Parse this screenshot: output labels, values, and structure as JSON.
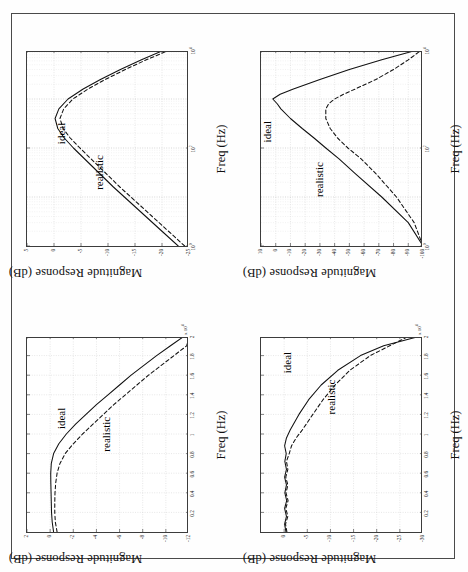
{
  "figure": {
    "background": "#fefefe",
    "frame_color": "#4a4a4a",
    "orientation": "rotated-90-ccw",
    "panel_count": 4
  },
  "labels": {
    "ylabel": "Magnitude Response (dB)",
    "xlabel": "Freq (Hz)",
    "series_ideal": "ideal",
    "series_realistic": "realistic"
  },
  "chart_data": [
    {
      "id": "top-left",
      "type": "line",
      "title": "",
      "xlabel": "Freq (Hz)",
      "ylabel": "Magnitude Response (dB)",
      "xscale": "log",
      "yscale": "linear",
      "xlim": [
        1,
        10000
      ],
      "ylim": [
        -25,
        5
      ],
      "xticks": [
        "10",
        "10",
        "10"
      ],
      "xtick_exponents": [
        "0",
        "2",
        "4"
      ],
      "yticks": [
        "5",
        "0",
        "-5",
        "-10",
        "-15",
        "-20",
        "-25"
      ],
      "grid": true,
      "annotations": [
        {
          "text": "ideal",
          "x": 120,
          "y": -2
        },
        {
          "text": "realistic",
          "x": 14,
          "y": -9
        }
      ],
      "series": [
        {
          "name": "ideal",
          "style": "solid",
          "x": [
            1,
            2,
            4,
            8,
            16,
            32,
            64,
            100,
            160,
            250,
            400,
            630,
            1000,
            1600,
            2500,
            4000,
            6300,
            10000
          ],
          "y": [
            -23.0,
            -20.0,
            -17.0,
            -14.0,
            -11.0,
            -8.2,
            -5.4,
            -3.6,
            -1.9,
            -0.7,
            -0.2,
            -0.9,
            -2.6,
            -5.4,
            -8.6,
            -12.3,
            -16.2,
            -20.4
          ]
        },
        {
          "name": "realistic",
          "style": "dashed",
          "x": [
            1,
            2,
            4,
            8,
            16,
            32,
            64,
            100,
            160,
            250,
            400,
            630,
            1000,
            1600,
            2500,
            4000,
            6300,
            10000
          ],
          "y": [
            -24.2,
            -21.2,
            -18.2,
            -15.2,
            -12.2,
            -9.4,
            -6.6,
            -4.8,
            -3.0,
            -1.7,
            -1.1,
            -1.8,
            -3.5,
            -6.3,
            -9.5,
            -13.2,
            -17.1,
            -21.4
          ]
        }
      ]
    },
    {
      "id": "top-right",
      "type": "line",
      "title": "",
      "xlabel": "Freq (Hz)",
      "ylabel": "Magnitude Response (dB)",
      "xscale": "log",
      "yscale": "linear",
      "xlim": [
        1,
        10000
      ],
      "ylim": [
        -100,
        10
      ],
      "xticks": [
        "10",
        "10",
        "10"
      ],
      "xtick_exponents": [
        "0",
        "2",
        "4"
      ],
      "yticks": [
        "10",
        "0",
        "-10",
        "-20",
        "-30",
        "-40",
        "-50",
        "-60",
        "-70",
        "-80",
        "-90",
        "-100"
      ],
      "grid": true,
      "annotations": [
        {
          "text": "ideal",
          "x": 130,
          "y": 3
        },
        {
          "text": "realistic",
          "x": 10,
          "y": -32
        }
      ],
      "series": [
        {
          "name": "ideal",
          "style": "solid",
          "x": [
            1,
            3,
            10,
            30,
            60,
            100,
            160,
            250,
            400,
            630,
            800,
            1000,
            1250,
            1600,
            2500,
            4000,
            6300,
            10000
          ],
          "y": [
            -100,
            -90,
            -72,
            -54,
            -43,
            -34,
            -26,
            -18,
            -10,
            -3.5,
            -1.0,
            2.0,
            -3.0,
            -12,
            -30,
            -50,
            -72,
            -96
          ]
        },
        {
          "name": "realistic",
          "style": "dashed",
          "x": [
            1,
            3,
            10,
            30,
            60,
            100,
            160,
            250,
            400,
            630,
            800,
            1000,
            1250,
            1600,
            2500,
            4000,
            6300,
            10000
          ],
          "y": [
            -100,
            -94,
            -82,
            -68,
            -58,
            -49,
            -42,
            -37,
            -34,
            -34,
            -36,
            -40,
            -46,
            -54,
            -68,
            -80,
            -90,
            -99
          ]
        }
      ]
    },
    {
      "id": "bottom-left",
      "type": "line",
      "title": "",
      "xlabel": "Freq (Hz)",
      "ylabel": "Magnitude Response (dB)",
      "xscale": "linear",
      "yscale": "linear",
      "xlim": [
        0,
        2
      ],
      "ylim": [
        -12,
        2
      ],
      "x_multiplier": "x 10",
      "x_multiplier_exponent": "4",
      "xticks": [
        "0.2",
        "0.4",
        "0.6",
        "0.8",
        "1",
        "1.2",
        "1.4",
        "1.6",
        "1.8",
        "2"
      ],
      "yticks": [
        "2",
        "0",
        "-2",
        "-4",
        "-6",
        "-8",
        "-10",
        "-12"
      ],
      "grid": true,
      "annotations": [
        {
          "text": "ideal",
          "x": 1.05,
          "y": -1.3
        },
        {
          "text": "realistic",
          "x": 0.82,
          "y": -5.2
        }
      ],
      "series": [
        {
          "name": "ideal",
          "style": "solid",
          "x": [
            0,
            0.1,
            0.2,
            0.3,
            0.4,
            0.5,
            0.6,
            0.7,
            0.8,
            0.9,
            1.0,
            1.1,
            1.2,
            1.3,
            1.4,
            1.5,
            1.6,
            1.7,
            1.8,
            1.9,
            2.0
          ],
          "y": [
            -0.3,
            -0.18,
            -0.12,
            -0.1,
            -0.08,
            -0.06,
            -0.05,
            -0.1,
            -0.3,
            -0.75,
            -1.4,
            -2.2,
            -3.1,
            -4.0,
            -5.0,
            -6.0,
            -7.0,
            -8.1,
            -9.2,
            -10.4,
            -11.6
          ]
        },
        {
          "name": "realistic",
          "style": "dashed",
          "x": [
            0,
            0.1,
            0.2,
            0.3,
            0.4,
            0.5,
            0.6,
            0.7,
            0.8,
            0.9,
            1.0,
            1.1,
            1.2,
            1.3,
            1.4,
            1.5,
            1.6,
            1.7,
            1.8,
            1.9,
            2.0
          ],
          "y": [
            -0.6,
            -0.45,
            -0.4,
            -0.4,
            -0.42,
            -0.48,
            -0.6,
            -0.85,
            -1.3,
            -2.0,
            -2.8,
            -3.7,
            -4.6,
            -5.5,
            -6.5,
            -7.5,
            -8.5,
            -9.6,
            -10.7,
            -11.8,
            -12.0
          ]
        }
      ]
    },
    {
      "id": "bottom-right",
      "type": "line",
      "title": "",
      "xlabel": "Freq (Hz)",
      "ylabel": "Magnitude Response (dB)",
      "xscale": "linear",
      "yscale": "linear",
      "xlim": [
        0,
        2
      ],
      "ylim": [
        -30,
        5
      ],
      "x_multiplier": "x 10",
      "x_multiplier_exponent": "4",
      "xticks": [
        "0.2",
        "0.4",
        "0.6",
        "0.8",
        "1",
        "1.2",
        "1.4",
        "1.6",
        "1.8",
        "2"
      ],
      "yticks": [
        "0",
        "-5",
        "-10",
        "-15",
        "-20",
        "-25",
        "-30"
      ],
      "grid": true,
      "annotations": [
        {
          "text": "ideal",
          "x": 1.62,
          "y": -1.5
        },
        {
          "text": "realistic",
          "x": 1.2,
          "y": -11
        }
      ],
      "series": [
        {
          "name": "ideal",
          "style": "solid",
          "x": [
            0,
            0.08,
            0.16,
            0.24,
            0.32,
            0.4,
            0.48,
            0.56,
            0.64,
            0.72,
            0.8,
            0.88,
            0.96,
            1.04,
            1.2,
            1.35,
            1.5,
            1.65,
            1.8,
            1.9,
            2.0
          ],
          "y": [
            -0.4,
            -0.1,
            -0.5,
            -0.1,
            -0.55,
            -0.15,
            -0.5,
            -0.1,
            -0.5,
            -0.15,
            -0.45,
            -0.1,
            -0.5,
            -1.3,
            -3.2,
            -5.3,
            -8.0,
            -11.6,
            -16.5,
            -21.5,
            -29.5
          ]
        },
        {
          "name": "realistic",
          "style": "dashed",
          "x": [
            0,
            0.08,
            0.16,
            0.24,
            0.32,
            0.4,
            0.48,
            0.56,
            0.64,
            0.72,
            0.8,
            0.88,
            0.96,
            1.04,
            1.2,
            1.35,
            1.5,
            1.65,
            1.8,
            1.9,
            2.0
          ],
          "y": [
            -0.6,
            -0.3,
            -0.8,
            -0.35,
            -0.85,
            -0.4,
            -0.8,
            -0.35,
            -0.8,
            -0.5,
            -1.1,
            -1.6,
            -2.6,
            -3.9,
            -6.2,
            -8.4,
            -11.0,
            -14.2,
            -18.6,
            -22.8,
            -27.0
          ]
        }
      ]
    }
  ]
}
